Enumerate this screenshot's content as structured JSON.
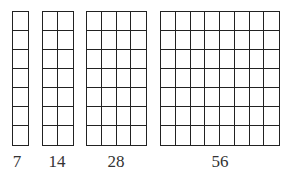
{
  "diagram": {
    "rows": 7,
    "line_color": "#222222",
    "grids": [
      {
        "columns": 1,
        "count_label": "7"
      },
      {
        "columns": 2,
        "count_label": "14"
      },
      {
        "columns": 4,
        "count_label": "28"
      },
      {
        "columns": 8,
        "count_label": "56"
      }
    ]
  }
}
